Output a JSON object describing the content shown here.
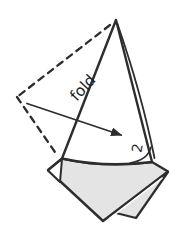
{
  "diagram": {
    "kind": "origami-fold-step",
    "fold_label": "fold",
    "step_number": "2",
    "colors": {
      "line": "#2d2d2d",
      "paper_white": "#ffffff",
      "paper_shade": "#e4e4e4",
      "background": "#ffffff",
      "text": "#1f1f1f"
    }
  }
}
